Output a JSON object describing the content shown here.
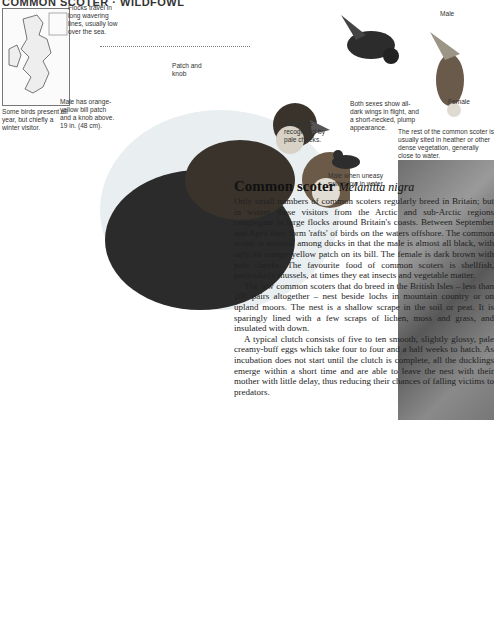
{
  "header": {
    "title": "COMMON SCOTER · WILDFOWL"
  },
  "map": {
    "caption": "Some birds present all year, but chiefly a winter visitor."
  },
  "captions": {
    "flocks": "Flocks travel in long wavering lines, usually low over the sea.",
    "male_bill": "Male has orange-yellow bill patch and a knob above. 19 in. (48 cm).",
    "patch_knob": "Patch and knob",
    "female_cheeks": "Female is recognised by pale cheeks.",
    "male_label": "Male",
    "female_label": "Female",
    "flight": "Both sexes show all-dark wings in flight, and a short-necked, plump appearance.",
    "swims_low": "Male when uneasy swims low in water.",
    "nest_photo": "The rest of the common scoter is usually sited in heather or other dense vegetation, generally close to water."
  },
  "article": {
    "title": "Common scoter",
    "latin": "Melanitta nigra",
    "paragraphs": [
      "Only small numbers of common scoters regularly breed in Britain; but in winter these visitors from the Arctic and sub-Arctic regions congregate in large flocks around Britain's coasts. Between September and April they form 'rafts' of birds on the waters offshore. The common scoter is unusual among ducks in that the male is almost all black, with only an orange-yellow patch on its bill. The female is dark brown with pale cheeks. The favourite food of common scoters is shellfish, particularly mussels, at times they eat insects and vegetable matter.",
      "The few common scoters that do breed in the British Isles – less than 200 pairs altogether – nest beside lochs in mountain country or on upland moors. The nest is a shallow scrape in the soil or peat. It is sparingly lined with a few scraps of lichen, moss and grass, and insulated with down.",
      "A typical clutch consists of five to ten smooth, slightly glossy, pale creamy-buff eggs which take four to four and a half weeks to hatch. As incubation does not start until the clutch is complete, all the ducklings emerge within a short time and are able to leave the nest with their mother with little delay, thus reducing their chances of falling victims to predators."
    ]
  }
}
